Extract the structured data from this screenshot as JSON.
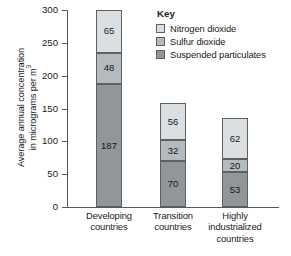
{
  "chart_data": {
    "type": "bar",
    "stacked": true,
    "title": "",
    "xlabel": "",
    "ylabel": "Average annual concentration in micrograms per m3",
    "ylabel_lines": [
      "Average annual concentration",
      "in micrograms per m"
    ],
    "ylabel_superscript": "3",
    "ylim": [
      0,
      300
    ],
    "yticks": [
      0,
      50,
      100,
      150,
      200,
      250,
      300
    ],
    "ytick_labels": [
      "0",
      "50",
      "100",
      "150",
      "200",
      "250",
      "300"
    ],
    "grid": false,
    "categories": [
      "Developing countries",
      "Transition countries",
      "Highly industrialized countries"
    ],
    "category_label_lines": [
      [
        "Developing",
        "countries"
      ],
      [
        "Transition",
        "countries"
      ],
      [
        "Highly",
        "industrialized",
        "countries"
      ]
    ],
    "series": [
      {
        "name": "Suspended particulates",
        "color": "#929699",
        "values": [
          187,
          70,
          53
        ]
      },
      {
        "name": "Sulfur dioxide",
        "color": "#b6babd",
        "values": [
          48,
          32,
          20
        ]
      },
      {
        "name": "Nitrogen dioxide",
        "color": "#dcdfe1",
        "values": [
          65,
          56,
          62
        ]
      }
    ],
    "totals": [
      300,
      158,
      135
    ],
    "legend": {
      "title": "Key",
      "position": "inside-top-right",
      "entries": [
        {
          "label": "Nitrogen dioxide",
          "color": "#dcdfe1"
        },
        {
          "label": "Sulfur dioxide",
          "color": "#b6babd"
        },
        {
          "label": "Suspended particulates",
          "color": "#929699"
        }
      ]
    }
  },
  "colors": {
    "axis": "#55595c",
    "segment_border": "#5d6164",
    "text": "#1a1a1a",
    "background": "#ffffff"
  }
}
